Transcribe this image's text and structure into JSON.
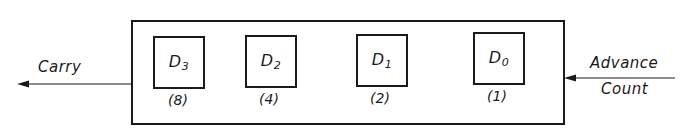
{
  "diagram": {
    "type": "4-bit binary counter block diagram",
    "stages": [
      {
        "name": "D",
        "subscript": "3",
        "weight": "(8)"
      },
      {
        "name": "D",
        "subscript": "2",
        "weight": "(4)"
      },
      {
        "name": "D",
        "subscript": "1",
        "weight": "(2)"
      },
      {
        "name": "D",
        "subscript": "0",
        "weight": "(1)"
      }
    ],
    "output_label": "Carry",
    "input_label_line1": "Advance",
    "input_label_line2": "Count",
    "colors": {
      "stroke": "#1a1a1a",
      "background": "#ffffff"
    }
  }
}
